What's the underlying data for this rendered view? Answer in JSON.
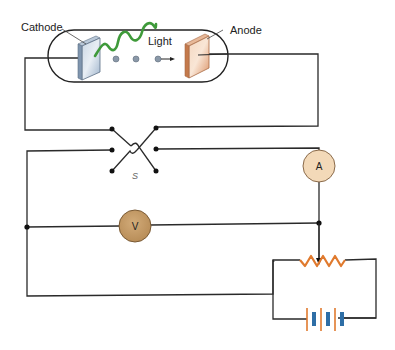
{
  "diagram": {
    "labels": {
      "cathode": "Cathode",
      "anode": "Anode",
      "light": "Light",
      "switch": "S",
      "ammeter": "A",
      "voltmeter": "V"
    },
    "components": [
      {
        "id": "tube",
        "type": "vacuum-tube"
      },
      {
        "id": "cathode",
        "type": "electrode",
        "color": "#9fb4cc"
      },
      {
        "id": "anode",
        "type": "electrode",
        "color": "#e2a27c"
      },
      {
        "id": "light",
        "type": "wave",
        "color": "#3f9a3a"
      },
      {
        "id": "switch",
        "type": "reversing-switch",
        "label": "S"
      },
      {
        "id": "ammeter",
        "type": "meter",
        "label": "A",
        "color": "#f3d9b8"
      },
      {
        "id": "voltmeter",
        "type": "meter",
        "label": "V",
        "color": "#c49a64"
      },
      {
        "id": "rheostat",
        "type": "variable-resistor",
        "color": "#e07a2e"
      },
      {
        "id": "battery",
        "type": "battery",
        "cells": 3,
        "colors": [
          "#e07a2e",
          "#2e6ea6"
        ]
      }
    ],
    "colors": {
      "wire": "#2a2a2a",
      "electron": "#8a98a8",
      "light_wave": "#3f9a3a",
      "resistor": "#e07a2e",
      "battery_long": "#e07a2e",
      "battery_short": "#2e6ea6",
      "ammeter_fill": "#f3d9b8",
      "voltmeter_fill": "#c49a64"
    }
  }
}
